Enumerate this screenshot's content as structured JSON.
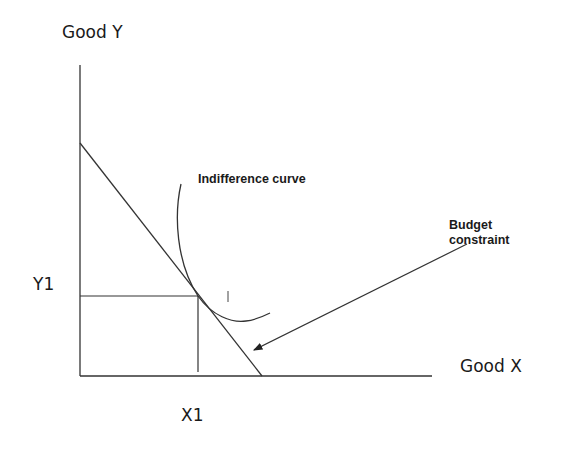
{
  "diagram": {
    "type": "indifference-curve-budget-constraint",
    "y_axis_label": "Good Y",
    "x_axis_label": "Good X",
    "y1_label": "Y1",
    "x1_label": "X1",
    "curve_label": "Indifference curve",
    "curve_marker": "I",
    "budget_label_line1": "Budget",
    "budget_label_line2": "constraint",
    "line_color": "#333333"
  }
}
